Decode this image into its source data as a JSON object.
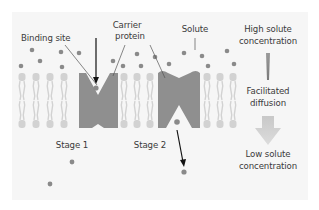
{
  "diagram": {
    "labels": {
      "binding_site": "Binding site",
      "carrier_protein_line1": "Carrier",
      "carrier_protein_line2": "protein",
      "solute": "Solute",
      "high_line1": "High solute",
      "high_line2": "concentration",
      "facilitated_line1": "Facilitated",
      "facilitated_line2": "diffusion",
      "low_line1": "Low solute",
      "low_line2": "concentration",
      "stage1": "Stage 1",
      "stage2": "Stage 2"
    },
    "colors": {
      "background_panel": "#f6f6f6",
      "protein": "#8f8f8f",
      "solute": "#8a8a8a",
      "lipid": "#d2d2d2",
      "gradient_arrow": "#bdbdbd",
      "pointer_arrow": "#111111",
      "text": "#3a3a3a"
    },
    "stages": [
      {
        "name": "Stage 1",
        "state": "open to outside, solute bound at binding site"
      },
      {
        "name": "Stage 2",
        "state": "open to inside, solute released"
      }
    ]
  }
}
